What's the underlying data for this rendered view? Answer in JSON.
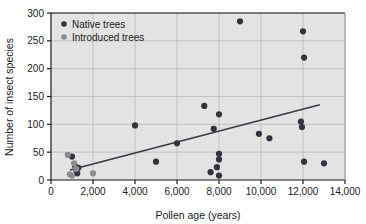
{
  "chart_data": {
    "type": "scatter",
    "title": "",
    "xlabel": "Pollen age (years)",
    "ylabel": "Number of insect species",
    "xlim": [
      0,
      14000
    ],
    "ylim": [
      0,
      300
    ],
    "xticks": [
      0,
      2000,
      4000,
      6000,
      8000,
      10000,
      12000,
      14000
    ],
    "xtick_labels": [
      "0",
      "2,000",
      "4,000",
      "6,000",
      "8,000",
      "10,000",
      "12,000",
      "14,000"
    ],
    "yticks": [
      0,
      50,
      100,
      150,
      200,
      250,
      300
    ],
    "ytick_labels": [
      "0",
      "50",
      "100",
      "150",
      "200",
      "250",
      "300"
    ],
    "grid": true,
    "plot_background": "#e3e3e3",
    "legend_position": "top-left",
    "series": [
      {
        "name": "Native trees",
        "color": "#33333f",
        "marker": "circle",
        "points": [
          [
            1000,
            42
          ],
          [
            1150,
            25
          ],
          [
            1200,
            18
          ],
          [
            1250,
            12
          ],
          [
            1300,
            22
          ],
          [
            4000,
            98
          ],
          [
            5000,
            33
          ],
          [
            6000,
            66
          ],
          [
            7300,
            133
          ],
          [
            7600,
            14
          ],
          [
            7750,
            92
          ],
          [
            7900,
            23
          ],
          [
            8000,
            118
          ],
          [
            8000,
            47
          ],
          [
            8000,
            37
          ],
          [
            8000,
            8
          ],
          [
            9000,
            285
          ],
          [
            9900,
            83
          ],
          [
            10400,
            75
          ],
          [
            11900,
            105
          ],
          [
            11950,
            95
          ],
          [
            12000,
            267
          ],
          [
            12050,
            220
          ],
          [
            12050,
            33
          ],
          [
            13000,
            30
          ]
        ]
      },
      {
        "name": "Introduced trees",
        "color": "#8c8c92",
        "marker": "circle",
        "points": [
          [
            800,
            45
          ],
          [
            900,
            10
          ],
          [
            1000,
            8
          ],
          [
            1100,
            30
          ],
          [
            1200,
            20
          ],
          [
            2000,
            12
          ]
        ]
      }
    ],
    "trendline": {
      "x_start": 900,
      "y_start": 18,
      "x_end": 12800,
      "y_end": 135,
      "color": "#3a3a46"
    }
  },
  "legend": {
    "entries": [
      {
        "label": "Native trees",
        "color": "#33333f"
      },
      {
        "label": "Introduced trees",
        "color": "#8c8c92"
      }
    ]
  }
}
